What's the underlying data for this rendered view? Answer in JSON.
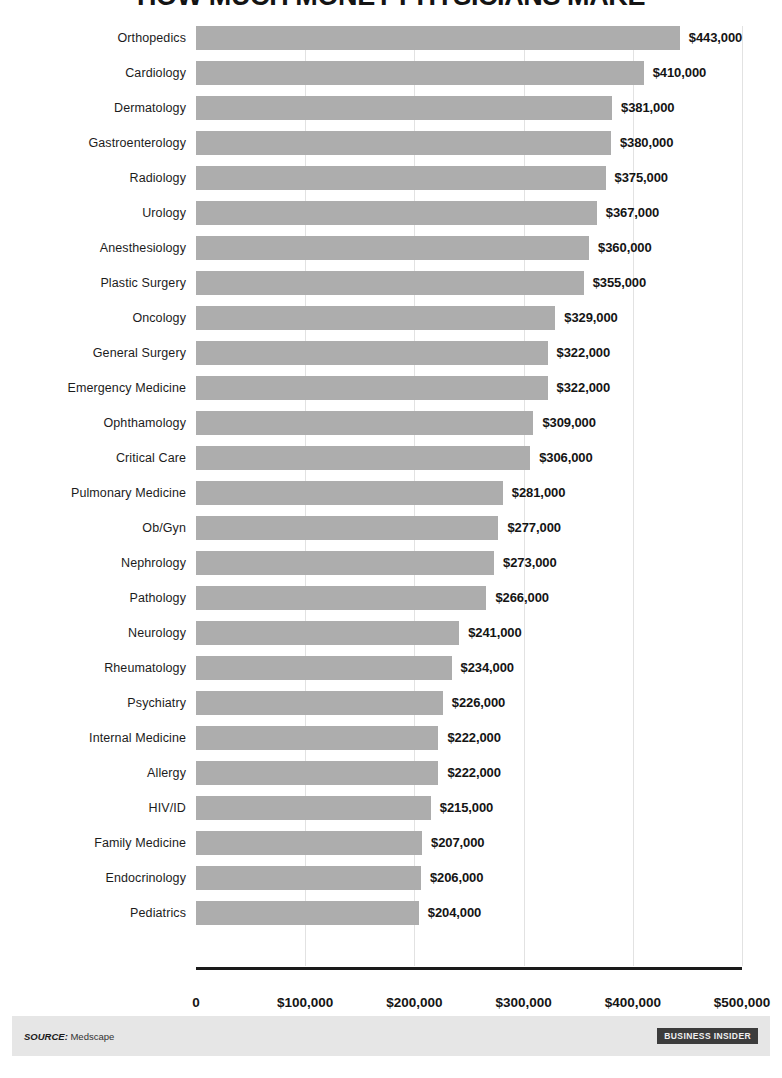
{
  "title": "HOW MUCH MONEY PHYSICIANS MAKE",
  "footer": {
    "source_key": "SOURCE:",
    "source_value": "Medscape",
    "logo": "BUSINESS INSIDER"
  },
  "colors": {
    "bar": "#adadad",
    "gridline": "#e2e2e2",
    "axis": "#1a1a1a",
    "footer_band": "#e6e6e6",
    "logo_badge": "#3c3c3c",
    "text": "#141414"
  },
  "chart_data": {
    "type": "bar",
    "orientation": "horizontal",
    "title": "HOW MUCH MONEY PHYSICIANS MAKE",
    "xlabel": "",
    "ylabel": "",
    "xlim": [
      0,
      500000
    ],
    "grid": true,
    "legend": false,
    "xticks": [
      0,
      100000,
      200000,
      300000,
      400000,
      500000
    ],
    "xtick_labels": [
      "0",
      "$100,000",
      "$200,000",
      "$300,000",
      "$400,000",
      "$500,000"
    ],
    "categories": [
      "Orthopedics",
      "Cardiology",
      "Dermatology",
      "Gastroenterology",
      "Radiology",
      "Urology",
      "Anesthesiology",
      "Plastic Surgery",
      "Oncology",
      "General Surgery",
      "Emergency Medicine",
      "Ophthamology",
      "Critical Care",
      "Pulmonary Medicine",
      "Ob/Gyn",
      "Nephrology",
      "Pathology",
      "Neurology",
      "Rheumatology",
      "Psychiatry",
      "Internal Medicine",
      "Allergy",
      "HIV/ID",
      "Family Medicine",
      "Endocrinology",
      "Pediatrics"
    ],
    "values": [
      443000,
      410000,
      381000,
      380000,
      375000,
      367000,
      360000,
      355000,
      329000,
      322000,
      322000,
      309000,
      306000,
      281000,
      277000,
      273000,
      266000,
      241000,
      234000,
      226000,
      222000,
      222000,
      215000,
      207000,
      206000,
      204000
    ],
    "value_labels": [
      "$443,000",
      "$410,000",
      "$381,000",
      "$380,000",
      "$375,000",
      "$367,000",
      "$360,000",
      "$355,000",
      "$329,000",
      "$322,000",
      "$322,000",
      "$309,000",
      "$306,000",
      "$281,000",
      "$277,000",
      "$273,000",
      "$266,000",
      "$241,000",
      "$234,000",
      "$226,000",
      "$222,000",
      "$222,000",
      "$215,000",
      "$207,000",
      "$206,000",
      "$204,000"
    ]
  }
}
